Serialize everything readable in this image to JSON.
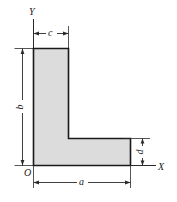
{
  "figure": {
    "kind": "engineering-cross-section",
    "shape_name": "L-shaped angle section",
    "fill_color": "#dcdcdc",
    "outline_color": "#1a1a1a",
    "dimension_line_color": "#2a2a2a",
    "background_color": "#ffffff"
  },
  "axes": {
    "x_label": "X",
    "y_label": "Y",
    "origin_label": "O"
  },
  "dimensions": {
    "a": {
      "label": "a",
      "description": "overall horizontal width along X axis",
      "orientation": "horizontal",
      "position": "below-shape"
    },
    "b": {
      "label": "b",
      "description": "overall vertical height along Y axis",
      "orientation": "vertical",
      "position": "left-of-shape"
    },
    "c": {
      "label": "c",
      "description": "width of the vertical leg",
      "orientation": "horizontal",
      "position": "above-shape"
    },
    "d": {
      "label": "d",
      "description": "thickness of the horizontal leg",
      "orientation": "vertical",
      "position": "right-of-shape"
    }
  }
}
